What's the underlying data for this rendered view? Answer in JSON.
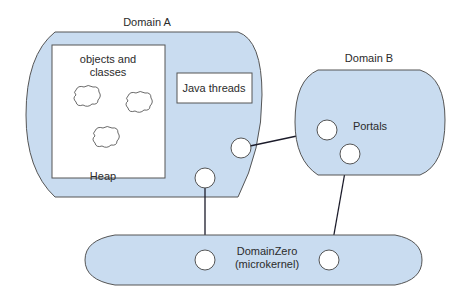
{
  "diagram": {
    "domain_a": {
      "title": "Domain A",
      "heap_box_label_line1": "objects and",
      "heap_box_label_line2": "classes",
      "threads_label": "Java threads",
      "heap_label": "Heap"
    },
    "domain_b": {
      "title": "Domain B",
      "portals_label": "Portals"
    },
    "domain_zero": {
      "label_line1": "DomainZero",
      "label_line2": "(microkernel)"
    },
    "colors": {
      "domain_fill": "#c9dcf0",
      "outline": "#3a3a3a",
      "box_fill": "#ffffff"
    }
  }
}
